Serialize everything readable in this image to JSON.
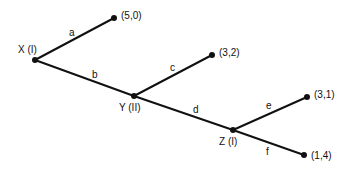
{
  "diagram": {
    "type": "game-tree",
    "nodes": [
      {
        "id": "X",
        "label": "X (I)",
        "x": 35,
        "y": 60,
        "lx": 18,
        "ly": 53
      },
      {
        "id": "Y",
        "label": "Y (II)",
        "x": 134,
        "y": 96,
        "lx": 119,
        "ly": 111
      },
      {
        "id": "Z",
        "label": "Z (I)",
        "x": 233,
        "y": 130,
        "lx": 219,
        "ly": 145
      }
    ],
    "leaves": [
      {
        "id": "L1",
        "label": "(5,0)",
        "x": 114,
        "y": 18,
        "lx": 121,
        "ly": 19
      },
      {
        "id": "L2",
        "label": "(3,2)",
        "x": 212,
        "y": 55,
        "lx": 219,
        "ly": 56
      },
      {
        "id": "L3",
        "label": "(3,1)",
        "x": 307,
        "y": 97,
        "lx": 314,
        "ly": 98
      },
      {
        "id": "L4",
        "label": "(1,4)",
        "x": 304,
        "y": 155,
        "lx": 311,
        "ly": 159
      }
    ],
    "edges": [
      {
        "label": "a",
        "x1": 35,
        "y1": 60,
        "x2": 114,
        "y2": 18,
        "lx": 69,
        "ly": 36
      },
      {
        "label": "b",
        "x1": 35,
        "y1": 60,
        "x2": 134,
        "y2": 96,
        "lx": 92,
        "ly": 78
      },
      {
        "label": "c",
        "x1": 134,
        "y1": 96,
        "x2": 212,
        "y2": 55,
        "lx": 170,
        "ly": 71
      },
      {
        "label": "d",
        "x1": 134,
        "y1": 96,
        "x2": 233,
        "y2": 130,
        "lx": 193,
        "ly": 113
      },
      {
        "label": "e",
        "x1": 233,
        "y1": 130,
        "x2": 307,
        "y2": 97,
        "lx": 266,
        "ly": 109
      },
      {
        "label": "f",
        "x1": 233,
        "y1": 130,
        "x2": 304,
        "y2": 155,
        "lx": 266,
        "ly": 155
      }
    ]
  }
}
